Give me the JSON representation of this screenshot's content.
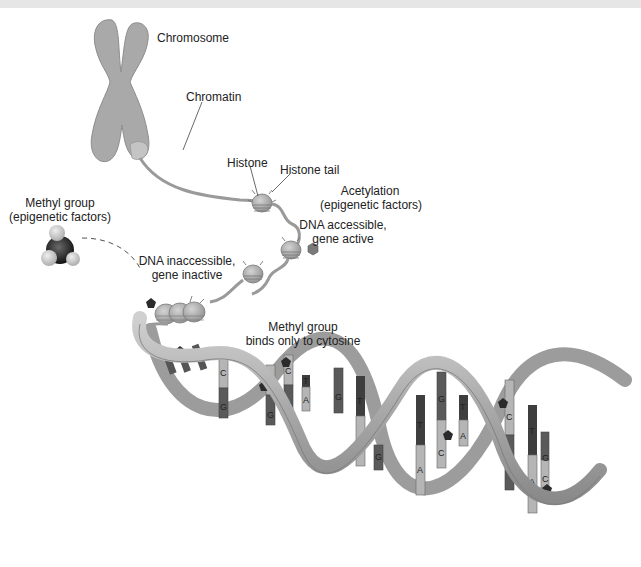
{
  "figure": {
    "labels": {
      "chromosome": "Chromosome",
      "chromatin": "Chromatin",
      "histone": "Histone",
      "histone_tail": "Histone tail",
      "acetylation_line1": "Acetylation",
      "acetylation_line2": "(epigenetic factors)",
      "accessible_line1": "DNA accessible,",
      "accessible_line2": "gene active",
      "methyl_line1": "Methyl group",
      "methyl_line2": "(epigenetic factors)",
      "inaccessible_line1": "DNA inaccessible,",
      "inaccessible_line2": "gene inactive",
      "binds_line1": "Methyl group",
      "binds_line2": "binds only to cytosine"
    },
    "base_pairs": [
      {
        "top": "C",
        "bottom": "G",
        "methylated": true
      },
      {
        "top": "C",
        "bottom": "G",
        "methylated": true
      },
      {
        "top": "C",
        "bottom": "G",
        "methylated": true
      },
      {
        "top": "T",
        "bottom": "A",
        "methylated": false
      },
      {
        "top": "G",
        "bottom": "",
        "methylated": false
      },
      {
        "top": "T",
        "bottom": "A",
        "methylated": false
      },
      {
        "top": "G",
        "bottom": "",
        "methylated": false
      },
      {
        "top": "T",
        "bottom": "A",
        "methylated": false
      },
      {
        "top": "G",
        "bottom": "C",
        "methylated": true
      },
      {
        "top": "T",
        "bottom": "A",
        "methylated": false
      },
      {
        "top": "C",
        "bottom": "G",
        "methylated": true
      },
      {
        "top": "T",
        "bottom": "A",
        "methylated": false
      },
      {
        "top": "G",
        "bottom": "C",
        "methylated": true
      }
    ],
    "colors": {
      "structure_gray": "#a8a8a8",
      "dark_base": "#555555",
      "light_base": "#b5b5b5",
      "methyl_marker": "#2b2b2b"
    }
  }
}
